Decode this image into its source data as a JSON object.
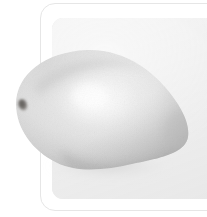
{
  "canvas": {
    "width": 207,
    "height": 217,
    "background_color": "#ffffff"
  },
  "card": {
    "border_color": "#e6e6e6",
    "corner_radius": 15,
    "label": "Image card"
  },
  "panel": {
    "background_color": "#ebebeb",
    "corner_radius": 11,
    "label": "Photo panel"
  },
  "photo": {
    "subject": "mango",
    "alt_text": "Desaturated photograph of a single mango resting on a light gray panel",
    "orientation": "tilted, stem end at lower left",
    "palette": {
      "highlight": "#fbfbfb",
      "midtone": "#dcdcdc",
      "shadow": "#b4b4b4",
      "deep_shadow": "#9a9a9a",
      "stem_spot": "#6d6a67",
      "contact_shadow": "#d6d6d6"
    },
    "bounds": {
      "left": 14,
      "top": 50,
      "right": 190,
      "bottom": 172
    },
    "stem_marker": {
      "x": 22,
      "y": 104,
      "label": "stem-end"
    }
  }
}
